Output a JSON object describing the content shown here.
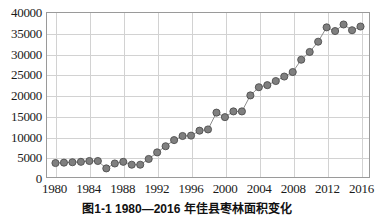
{
  "caption": "图1-1  1980—2016 年佳县枣林面积变化",
  "colors": {
    "marker_fill": "#7f7f7f",
    "marker_stroke": "#4d4d4d",
    "line": "#8c8c8c",
    "grid": "#d2d2d2",
    "frame": "#9a9a9a",
    "text": "#1a1a1a"
  },
  "chart_data": {
    "type": "line",
    "title": "图1-1  1980—2016 年佳县枣林面积变化",
    "xlabel": "",
    "ylabel": "",
    "xlim": [
      1979,
      2017
    ],
    "ylim": [
      0,
      40000
    ],
    "grid": true,
    "legend": "none",
    "markers": true,
    "y_ticks": [
      0,
      5000,
      10000,
      15000,
      20000,
      25000,
      30000,
      35000,
      40000
    ],
    "y_tick_labels": [
      "0",
      "5000",
      "10000",
      "15000",
      "20000",
      "25000",
      "30000",
      "35000",
      "40000"
    ],
    "x_ticks": [
      1980,
      1984,
      1988,
      1992,
      1996,
      2000,
      2004,
      2008,
      2012,
      2016
    ],
    "x_tick_labels": [
      "1980",
      "1984",
      "1988",
      "1992",
      "1996",
      "2000",
      "2004",
      "2008",
      "2012",
      "2016"
    ],
    "x": [
      1980,
      1981,
      1982,
      1983,
      1984,
      1985,
      1986,
      1987,
      1988,
      1989,
      1990,
      1991,
      1992,
      1993,
      1994,
      1995,
      1996,
      1997,
      1998,
      1999,
      2000,
      2001,
      2002,
      2003,
      2004,
      2005,
      2006,
      2007,
      2008,
      2009,
      2010,
      2011,
      2012,
      2013,
      2014,
      2015,
      2016
    ],
    "values": [
      3400,
      3500,
      3600,
      3700,
      3900,
      3900,
      2100,
      3300,
      3700,
      3000,
      3000,
      4400,
      6000,
      7500,
      9000,
      10000,
      10100,
      11300,
      11600,
      15700,
      14600,
      16000,
      16000,
      19900,
      21900,
      22400,
      23400,
      24500,
      25600,
      28600,
      30500,
      33000,
      36500,
      35600,
      37200,
      35800,
      36700
    ],
    "series": [
      {
        "name": "佳县枣林面积",
        "values": [
          3400,
          3500,
          3600,
          3700,
          3900,
          3900,
          2100,
          3300,
          3700,
          3000,
          3000,
          4400,
          6000,
          7500,
          9000,
          10000,
          10100,
          11300,
          11600,
          15700,
          14600,
          16000,
          16000,
          19900,
          21900,
          22400,
          23400,
          24500,
          25600,
          28600,
          30500,
          33000,
          36500,
          35600,
          37200,
          35800,
          36700
        ]
      }
    ]
  }
}
